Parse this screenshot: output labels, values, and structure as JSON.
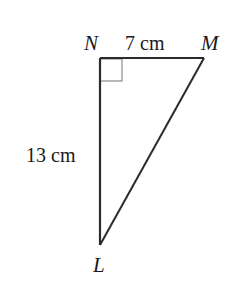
{
  "diagram": {
    "type": "right-triangle",
    "vertices": {
      "N": {
        "label": "N",
        "x": 100,
        "y": 58
      },
      "M": {
        "label": "M",
        "x": 204,
        "y": 58
      },
      "L": {
        "label": "L",
        "x": 100,
        "y": 245
      }
    },
    "right_angle_at": "N",
    "sides": {
      "NM": {
        "label": "7 cm"
      },
      "NL": {
        "label": "13 cm"
      },
      "ML": {
        "label": ""
      }
    },
    "colors": {
      "stroke": "#2a2a2a",
      "right_angle_mark": "#8a8a8a",
      "text": "#1a1a1a"
    }
  }
}
